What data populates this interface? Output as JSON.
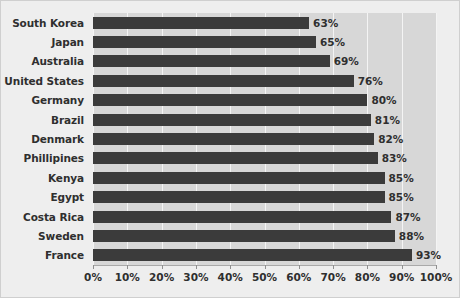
{
  "chart_data": {
    "type": "bar",
    "orientation": "horizontal",
    "title": "",
    "subtitle": "",
    "xlabel": "",
    "ylabel": "",
    "xlim": [
      0,
      100
    ],
    "grid": true,
    "legend": false,
    "legend_position": "none",
    "value_suffix": "%",
    "categories": [
      "South Korea",
      "Japan",
      "Australia",
      "United States",
      "Germany",
      "Brazil",
      "Denmark",
      "Phillipines",
      "Kenya",
      "Egypt",
      "Costa Rica",
      "Sweden",
      "France"
    ],
    "values": [
      63,
      65,
      69,
      76,
      80,
      81,
      82,
      83,
      85,
      85,
      87,
      88,
      93
    ],
    "value_labels": [
      "63%",
      "65%",
      "69%",
      "76%",
      "80%",
      "81%",
      "82%",
      "83%",
      "85%",
      "85%",
      "87%",
      "88%",
      "93%"
    ],
    "xticks": [
      0,
      10,
      20,
      30,
      40,
      50,
      60,
      70,
      80,
      90,
      100
    ],
    "xtick_labels": [
      "0%",
      "10%",
      "20%",
      "30%",
      "40%",
      "50%",
      "60%",
      "70%",
      "80%",
      "90%",
      "100%"
    ]
  },
  "colors": {
    "bar": "#3b3b3b",
    "plot_background": "#d7d7d7",
    "figure_background": "#eeeeee",
    "gridline": "#f4f4f4",
    "text": "#2f2f2f",
    "axis_line": "#a9a9a9",
    "border": "#cfcfcf"
  }
}
